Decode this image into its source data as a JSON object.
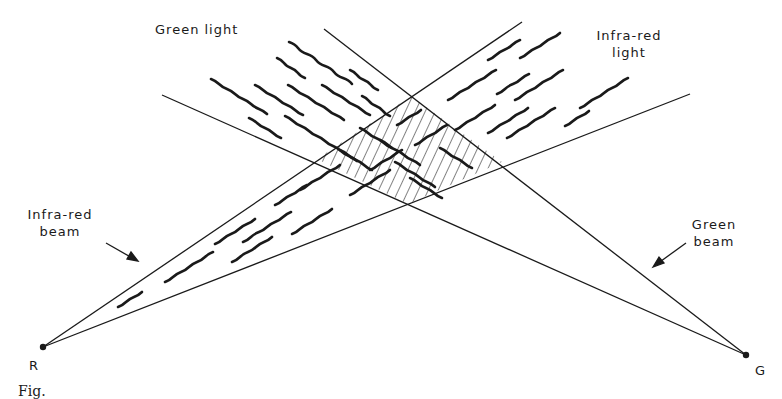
{
  "labels": {
    "green_light": "Green light",
    "infrared_light_line1": "Infra-red",
    "infrared_light_line2": "light",
    "infrared_beam_line1": "Infra-red",
    "infrared_beam_line2": "beam",
    "green_beam_line1": "Green",
    "green_beam_line2": "beam",
    "source_r": "R",
    "source_g": "G",
    "caption": "Fig."
  },
  "colors": {
    "ink": "#1a1a1a",
    "background": "#ffffff"
  },
  "geometry": {
    "source_r": [
      43,
      347
    ],
    "source_g": [
      746,
      355
    ],
    "ir_beam_upper_end": [
      522,
      22
    ],
    "ir_beam_lower_end": [
      690,
      94
    ],
    "green_beam_upper_end": [
      324,
      29
    ],
    "green_beam_lower_end": [
      162,
      95
    ],
    "overlap_region": [
      [
        411,
        96
      ],
      [
        502,
        162
      ],
      [
        408,
        204
      ],
      [
        317,
        159
      ]
    ]
  }
}
